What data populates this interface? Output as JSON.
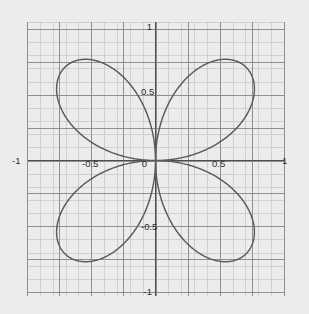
{
  "figure": {
    "title": "",
    "background_color": "#ececec",
    "plot_background_color": "#ececec",
    "curve_color": "#5a5a5a",
    "axis_color": "#555555",
    "major_grid_color": "#8c8c8c",
    "minor_grid_color": "#c9c9c9",
    "tick_label_color": "#2b2b2b"
  },
  "axes": {
    "x_axis_label": "",
    "y_axis_label": "",
    "x_tick_labels": [
      "-1",
      "-0.5",
      "0",
      "0.5",
      "1"
    ],
    "y_tick_labels": [
      "-1",
      "-0.5",
      "0.5",
      "1"
    ],
    "x_tick_values": [
      -1,
      -0.5,
      0,
      0.5,
      1
    ],
    "y_tick_values": [
      -1,
      -0.5,
      0.5,
      1
    ],
    "x_origin_label": "0",
    "grid": "on"
  },
  "labels": {
    "x_neg_one": "-1",
    "x_neg_half": "-0.5",
    "origin": "0",
    "x_pos_half": "0.5",
    "x_pos_one": "1",
    "y_pos_one": "1",
    "y_pos_half": "0.5",
    "y_neg_half": "-0.5",
    "y_neg_one": "-1"
  },
  "chart_data": {
    "type": "line",
    "title": "",
    "xlabel": "",
    "ylabel": "",
    "xlim": [
      -1.05,
      1.05
    ],
    "ylim": [
      -1.05,
      1.05
    ],
    "grid": "on",
    "legend": "none",
    "coordinate_system": "polar",
    "equation": "r = sin(2*theta)",
    "petal_count": 4,
    "max_radius": 1,
    "petal_tip_angles_deg": [
      45,
      135,
      225,
      315
    ],
    "petal_tips_xy": [
      [
        0.707,
        0.707
      ],
      [
        -0.707,
        0.707
      ],
      [
        -0.707,
        -0.707
      ],
      [
        0.707,
        -0.707
      ]
    ],
    "series": [
      {
        "name": "r = sin(2θ)",
        "color": "#5a5a5a",
        "theta_deg": [
          0,
          10,
          20,
          30,
          40,
          45,
          50,
          60,
          70,
          80,
          90,
          100,
          110,
          120,
          130,
          135,
          140,
          150,
          160,
          170,
          180,
          190,
          200,
          210,
          220,
          225,
          230,
          240,
          250,
          260,
          270,
          280,
          290,
          300,
          310,
          315,
          320,
          330,
          340,
          350,
          360
        ],
        "r": [
          0,
          0.342,
          0.643,
          0.866,
          0.985,
          1.0,
          0.985,
          0.866,
          0.643,
          0.342,
          0,
          -0.342,
          -0.643,
          -0.866,
          -0.985,
          -1.0,
          -0.985,
          -0.866,
          -0.643,
          -0.342,
          0,
          0.342,
          0.643,
          0.866,
          0.985,
          1.0,
          0.985,
          0.866,
          0.643,
          0.342,
          0,
          -0.342,
          -0.643,
          -0.866,
          -0.985,
          -1.0,
          -0.985,
          -0.866,
          -0.643,
          -0.342,
          0
        ]
      }
    ]
  }
}
